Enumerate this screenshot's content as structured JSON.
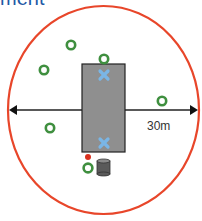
{
  "title": "ment",
  "diagram": {
    "boundary": {
      "shape": "circle",
      "color": "#e8462a"
    },
    "center_block": {
      "shape": "rectangle",
      "color": "#8a8a8a",
      "border": "#222222"
    },
    "distance_label": "30m",
    "arrows": [
      {
        "name": "left-arrow",
        "direction": "left"
      },
      {
        "name": "right-arrow",
        "direction": "right"
      }
    ],
    "markers": {
      "ring_color": "#3a8a3a",
      "cross_color": "#6aaee0",
      "cylinder_color": "#555555",
      "red_dot_color": "#d9301e",
      "rings_count": 7,
      "crosses_count": 2
    }
  }
}
